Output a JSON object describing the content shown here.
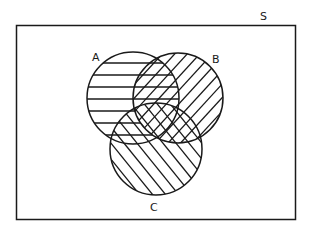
{
  "diagram": {
    "type": "venn",
    "universe_label": "S",
    "sets": [
      {
        "id": "A",
        "label": "A",
        "hatch": "horizontal"
      },
      {
        "id": "B",
        "label": "B",
        "hatch": "diagonal-forward"
      },
      {
        "id": "C",
        "label": "C",
        "hatch": "diagonal-backward"
      }
    ],
    "regions_shaded": [
      "A",
      "B",
      "C",
      "A∩B",
      "A∩C",
      "B∩C",
      "A∩B∩C"
    ],
    "line_color": "#1a1a1a",
    "background": "#ffffff"
  }
}
